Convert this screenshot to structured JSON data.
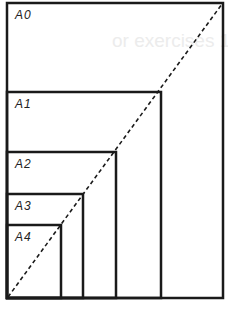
{
  "diagram": {
    "stroke_color": "#1a1a1a",
    "background": "#ffffff",
    "sheets": [
      {
        "label": "A0",
        "x": 7,
        "y": 3,
        "w": 216,
        "h": 295
      },
      {
        "label": "A1",
        "x": 7,
        "y": 92,
        "w": 154,
        "h": 206
      },
      {
        "label": "A2",
        "x": 7,
        "y": 152,
        "w": 109,
        "h": 146
      },
      {
        "label": "A3",
        "x": 7,
        "y": 194,
        "w": 76,
        "h": 104
      },
      {
        "label": "A4",
        "x": 7,
        "y": 225,
        "w": 54,
        "h": 73
      }
    ],
    "diagonal": {
      "x1": 8,
      "y1": 297,
      "x2": 222,
      "y2": 4,
      "style": "dashed"
    },
    "bleed_text": "or exercises 1"
  }
}
